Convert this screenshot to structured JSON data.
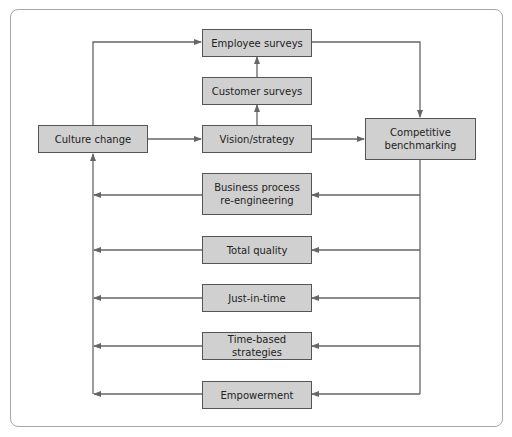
{
  "diagram": {
    "nodes": {
      "employee_surveys": "Employee surveys",
      "customer_surveys": "Customer surveys",
      "vision_strategy": "Vision/strategy",
      "culture_change": "Culture change",
      "competitive_benchmarking": "Competitive\nbenchmarking",
      "business_process": "Business process\nre-engineering",
      "total_quality": "Total quality",
      "just_in_time": "Just-in-time",
      "time_based": "Time-based strategies",
      "empowerment": "Empowerment"
    },
    "edges": [
      {
        "from": "culture_change",
        "to": "employee_surveys"
      },
      {
        "from": "culture_change",
        "to": "vision_strategy"
      },
      {
        "from": "vision_strategy",
        "to": "customer_surveys"
      },
      {
        "from": "customer_surveys",
        "to": "employee_surveys"
      },
      {
        "from": "vision_strategy",
        "to": "competitive_benchmarking"
      },
      {
        "from": "employee_surveys",
        "to": "competitive_benchmarking"
      },
      {
        "from": "competitive_benchmarking",
        "to": "business_process"
      },
      {
        "from": "competitive_benchmarking",
        "to": "total_quality"
      },
      {
        "from": "competitive_benchmarking",
        "to": "just_in_time"
      },
      {
        "from": "competitive_benchmarking",
        "to": "time_based"
      },
      {
        "from": "competitive_benchmarking",
        "to": "empowerment"
      },
      {
        "from": "business_process",
        "to": "culture_change"
      },
      {
        "from": "total_quality",
        "to": "culture_change"
      },
      {
        "from": "just_in_time",
        "to": "culture_change"
      },
      {
        "from": "time_based",
        "to": "culture_change"
      },
      {
        "from": "empowerment",
        "to": "culture_change"
      }
    ],
    "colors": {
      "box_fill": "#d0d0d0",
      "box_border": "#555555",
      "line": "#666666",
      "frame": "#a8a8a8"
    }
  }
}
